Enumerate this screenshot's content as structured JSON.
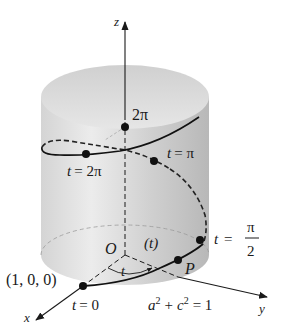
{
  "figure": {
    "axes": {
      "x": "x",
      "y": "y",
      "z": "z"
    },
    "origin_label": "O",
    "angle_label": "t",
    "arc_param_label": "(t)",
    "point_label": "P",
    "start_point_label": "(1, 0, 0)",
    "equation": {
      "a": "a",
      "c": "c",
      "sup": "2",
      "plus": "+",
      "rhs": "= 1"
    },
    "points": {
      "t0": {
        "lhs": "t",
        "rhs": "= 0"
      },
      "t_half_pi": {
        "lhs": "t",
        "eq": "=",
        "num": "π",
        "den": "2"
      },
      "t_pi": {
        "lhs": "t",
        "rhs": "= π"
      },
      "t_2pi": {
        "lhs": "t",
        "rhs": "= 2π"
      },
      "z_2pi": "2π"
    },
    "colors": {
      "cylinder_light": "#e8e8e8",
      "cylinder_dark": "#bdbdbd",
      "top_face": "#d9d9d9",
      "curve": "#111111",
      "dashed": "#222222",
      "axis": "#1a1a1a"
    }
  }
}
